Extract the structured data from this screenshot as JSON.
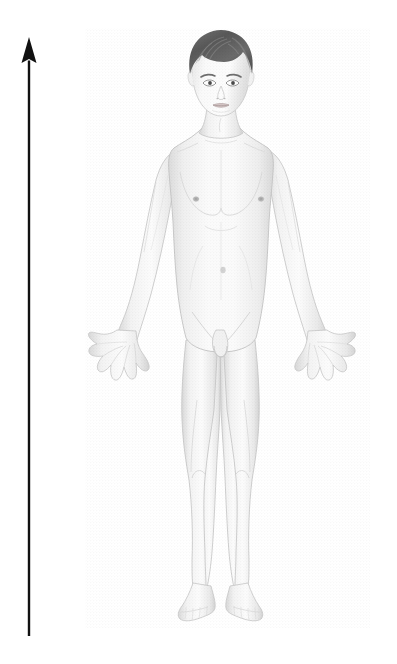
{
  "canvas": {
    "width": 397,
    "height": 664,
    "background_color": "#ffffff",
    "title": "Anterior view of standing adult male human body with vertical height arrow"
  },
  "arrow": {
    "name": "height-axis-arrow",
    "direction": "up",
    "color": "#111111",
    "shaft_x": 29,
    "tip_y": 37,
    "base_y": 636,
    "shaft_width": 2.4,
    "head_width": 15,
    "head_height": 26
  },
  "figure": {
    "name": "human-body-figure",
    "sex": "male",
    "view": "anterior",
    "pose": "standing, arms slightly abducted, palms forward, fingers spread",
    "skin_color": "#f2f2f2",
    "skin_shadow_color": "#d8d8d8",
    "outline_color": "#c8c8c8",
    "hair_color": "#5f5f5f",
    "hair_highlight_color": "#8a8a8a",
    "detail_color": "#b4b4b4",
    "bounds": {
      "x": 88,
      "y": 30,
      "width": 278,
      "height": 600
    },
    "parts": [
      {
        "name": "head",
        "label": "Head",
        "cx": 220,
        "cy": 80
      },
      {
        "name": "hair",
        "label": "Hair",
        "cx": 220,
        "cy": 50
      },
      {
        "name": "face",
        "label": "Face",
        "cx": 221,
        "cy": 88
      },
      {
        "name": "left-eye",
        "label": "Left eye",
        "cx": 209,
        "cy": 83
      },
      {
        "name": "right-eye",
        "label": "Right eye",
        "cx": 233,
        "cy": 83
      },
      {
        "name": "nose",
        "label": "Nose",
        "cx": 221,
        "cy": 95
      },
      {
        "name": "mouth",
        "label": "Mouth",
        "cx": 221,
        "cy": 105
      },
      {
        "name": "neck",
        "label": "Neck",
        "cx": 221,
        "cy": 124
      },
      {
        "name": "left-shoulder",
        "label": "Left shoulder",
        "cx": 172,
        "cy": 147
      },
      {
        "name": "right-shoulder",
        "label": "Right shoulder",
        "cx": 272,
        "cy": 147
      },
      {
        "name": "chest",
        "label": "Chest",
        "cx": 221,
        "cy": 195
      },
      {
        "name": "left-nipple",
        "label": "Left nipple",
        "cx": 196,
        "cy": 199
      },
      {
        "name": "right-nipple",
        "label": "Right nipple",
        "cx": 261,
        "cy": 199
      },
      {
        "name": "abdomen",
        "label": "Abdomen",
        "cx": 221,
        "cy": 250
      },
      {
        "name": "navel",
        "label": "Navel",
        "cx": 223,
        "cy": 270
      },
      {
        "name": "left-arm",
        "label": "Left arm",
        "cx": 152,
        "cy": 250
      },
      {
        "name": "right-arm",
        "label": "Right arm",
        "cx": 292,
        "cy": 250
      },
      {
        "name": "left-hand",
        "label": "Left hand",
        "cx": 113,
        "cy": 355
      },
      {
        "name": "right-hand",
        "label": "Right hand",
        "cx": 334,
        "cy": 355
      },
      {
        "name": "pelvis",
        "label": "Pelvis",
        "cx": 221,
        "cy": 330
      },
      {
        "name": "genitals",
        "label": "Genitals",
        "cx": 219,
        "cy": 348
      },
      {
        "name": "left-thigh",
        "label": "Left thigh",
        "cx": 196,
        "cy": 400
      },
      {
        "name": "right-thigh",
        "label": "Right thigh",
        "cx": 246,
        "cy": 400
      },
      {
        "name": "left-knee",
        "label": "Left knee",
        "cx": 197,
        "cy": 470
      },
      {
        "name": "right-knee",
        "label": "Right knee",
        "cx": 244,
        "cy": 470
      },
      {
        "name": "left-shin",
        "label": "Left lower leg",
        "cx": 198,
        "cy": 525
      },
      {
        "name": "right-shin",
        "label": "Right lower leg",
        "cx": 243,
        "cy": 525
      },
      {
        "name": "left-foot",
        "label": "Left foot",
        "cx": 198,
        "cy": 605
      },
      {
        "name": "right-foot",
        "label": "Right foot",
        "cx": 243,
        "cy": 605
      }
    ]
  }
}
